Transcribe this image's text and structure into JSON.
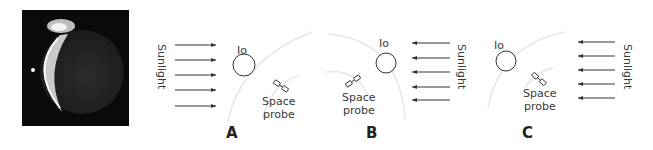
{
  "photo": {
    "subject": "io-crescent-with-plume",
    "alt": "Io"
  },
  "panels": [
    {
      "letter": "A",
      "io_label": "Io",
      "probe_label_1": "Space",
      "probe_label_2": "probe",
      "sun_label": "Sunlight",
      "sun_direction": "left-to-right"
    },
    {
      "letter": "B",
      "io_label": "Io",
      "probe_label_1": "Space",
      "probe_label_2": "probe",
      "sun_label": "Sunlight",
      "sun_direction": "right-to-left"
    },
    {
      "letter": "C",
      "io_label": "Io",
      "probe_label_1": "Space",
      "probe_label_2": "probe",
      "sun_label": "Sunlight",
      "sun_direction": "right-to-left"
    }
  ],
  "colors": {
    "line": "#333333",
    "arc": "#e6e6e6",
    "photo_bg": "#0a0a0a"
  }
}
